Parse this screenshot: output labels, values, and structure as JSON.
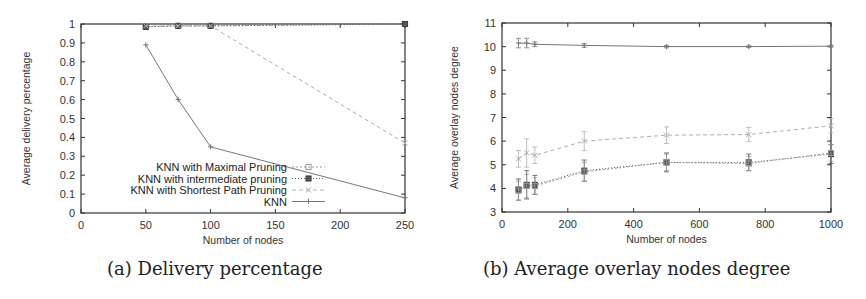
{
  "chart_data": [
    {
      "id": "a",
      "type": "line",
      "caption": "(a) Delivery percentage",
      "title": "",
      "xlabel": "Number of nodes",
      "ylabel": "Average delivery percentage",
      "xlim": [
        0,
        250
      ],
      "ylim": [
        0,
        1
      ],
      "xticks": [
        0,
        50,
        100,
        150,
        200,
        250
      ],
      "yticks": [
        0,
        0.1,
        0.2,
        0.3,
        0.4,
        0.5,
        0.6,
        0.7,
        0.8,
        0.9,
        1
      ],
      "ytick_labels": [
        "0",
        "0.1",
        "0.2",
        "0.3",
        "0.4",
        "0.5",
        "0.6",
        "0.7",
        "0.8",
        "0.9",
        "1"
      ],
      "grid": false,
      "legend_position": "lower center",
      "series": [
        {
          "name": "KNN with Maximal Pruning",
          "marker": "square-open",
          "dash": "2,2",
          "x": [
            50,
            75,
            100,
            250
          ],
          "values": [
            0.985,
            0.99,
            0.99,
            1.0
          ]
        },
        {
          "name": "KNN with intermediate pruning",
          "marker": "square-filled",
          "dash": "1,2",
          "x": [
            50,
            75,
            100,
            250
          ],
          "values": [
            0.985,
            0.99,
            0.99,
            1.0
          ]
        },
        {
          "name": "KNN with Shortest Path Pruning",
          "marker": "x",
          "dash": "4,3",
          "x": [
            50,
            75,
            100,
            250
          ],
          "values": [
            0.99,
            0.99,
            0.99,
            0.37
          ]
        },
        {
          "name": "KNN",
          "marker": "plus",
          "dash": "",
          "x": [
            50,
            75,
            100,
            250
          ],
          "values": [
            0.89,
            0.6,
            0.35,
            0.08
          ]
        }
      ]
    },
    {
      "id": "b",
      "type": "line",
      "caption": "(b) Average overlay nodes degree",
      "title": "",
      "xlabel": "Number of nodes",
      "ylabel": "Average overlay nodes degree",
      "xlim": [
        0,
        1000
      ],
      "ylim": [
        3,
        11
      ],
      "xticks": [
        0,
        200,
        400,
        600,
        800,
        1000
      ],
      "yticks": [
        3,
        4,
        5,
        6,
        7,
        8,
        9,
        10,
        11
      ],
      "ytick_labels": [
        "3",
        "4",
        "5",
        "6",
        "7",
        "8",
        "9",
        "10",
        "11"
      ],
      "grid": false,
      "error_bars": true,
      "series": [
        {
          "name": "KNN",
          "marker": "plus",
          "dash": "",
          "x": [
            50,
            75,
            100,
            250,
            500,
            750,
            1000
          ],
          "values": [
            10.15,
            10.15,
            10.1,
            10.05,
            10.0,
            10.0,
            10.02
          ],
          "err": [
            0.2,
            0.2,
            0.1,
            0.08,
            0.05,
            0.04,
            0.04
          ]
        },
        {
          "name": "KNN with Shortest Path Pruning",
          "marker": "x",
          "dash": "4,3",
          "x": [
            50,
            75,
            100,
            250,
            500,
            750,
            1000
          ],
          "values": [
            5.25,
            5.5,
            5.4,
            6.0,
            6.25,
            6.28,
            6.65
          ],
          "err": [
            0.35,
            0.6,
            0.35,
            0.4,
            0.35,
            0.3,
            0.3
          ]
        },
        {
          "name": "KNN with intermediate pruning",
          "marker": "square-filled",
          "dash": "1,2",
          "x": [
            50,
            75,
            100,
            250,
            500,
            750,
            1000
          ],
          "values": [
            3.95,
            4.15,
            4.15,
            4.75,
            5.1,
            5.1,
            5.45
          ],
          "err": [
            0.45,
            0.6,
            0.4,
            0.45,
            0.4,
            0.35,
            0.4
          ]
        },
        {
          "name": "KNN with Maximal Pruning",
          "marker": "square-open",
          "dash": "2,2",
          "x": [
            50,
            75,
            100,
            250,
            500,
            750,
            1000
          ],
          "values": [
            3.9,
            4.1,
            4.1,
            4.7,
            5.1,
            5.05,
            5.5
          ],
          "err": [
            0.4,
            0.5,
            0.35,
            0.4,
            0.35,
            0.3,
            0.35
          ]
        }
      ]
    }
  ],
  "captions": {
    "a": "(a) Delivery percentage",
    "b": "(b) Average overlay nodes degree"
  },
  "colors": {
    "axis": "#333333",
    "knn": "#777777",
    "shortest": "#b0b0b0",
    "intermediate": "#555555",
    "maximal": "#999999"
  }
}
